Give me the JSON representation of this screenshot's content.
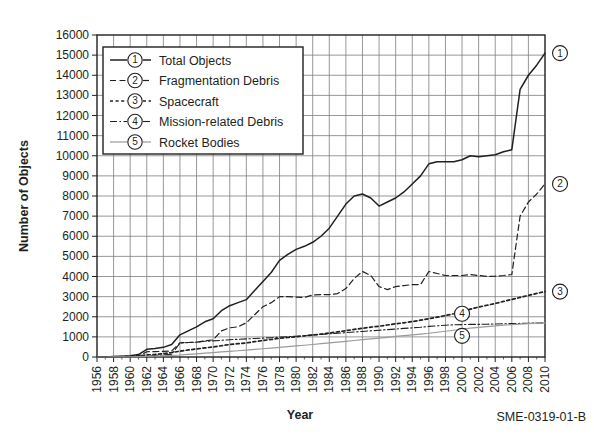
{
  "chart_data": {
    "type": "line",
    "title": "",
    "xlabel": "Year",
    "ylabel": "Number of Objects",
    "xlim": [
      1956,
      2010
    ],
    "ylim": [
      0,
      16000
    ],
    "grid": true,
    "legend_position": "top-left",
    "caption": "SME-0319-01-B",
    "y_ticks": [
      "0",
      "1000",
      "2000",
      "3000",
      "4000",
      "5000",
      "6000",
      "7000",
      "8000",
      "9000",
      "10000",
      "11000",
      "12000",
      "13000",
      "14000",
      "15000",
      "16000"
    ],
    "x_ticks": [
      "1956",
      "1958",
      "1960",
      "1962",
      "1964",
      "1966",
      "1968",
      "1970",
      "1972",
      "1974",
      "1976",
      "1978",
      "1980",
      "1982",
      "1984",
      "1986",
      "1988",
      "1990",
      "1992",
      "1994",
      "1996",
      "1998",
      "2000",
      "2002",
      "2004",
      "2006",
      "2008",
      "2010"
    ],
    "x": [
      1956,
      1957,
      1958,
      1959,
      1960,
      1961,
      1962,
      1963,
      1964,
      1965,
      1966,
      1967,
      1968,
      1969,
      1970,
      1971,
      1972,
      1973,
      1974,
      1975,
      1976,
      1977,
      1978,
      1979,
      1980,
      1981,
      1982,
      1983,
      1984,
      1985,
      1986,
      1987,
      1988,
      1989,
      1990,
      1991,
      1992,
      1993,
      1994,
      1995,
      1996,
      1997,
      1998,
      1999,
      2000,
      2001,
      2002,
      2003,
      2004,
      2005,
      2006,
      2007,
      2008,
      2009,
      2010
    ],
    "series": [
      {
        "name": "Total Objects",
        "marker": "1",
        "style": "solid",
        "end_value": 15100,
        "values": [
          0,
          5,
          20,
          40,
          60,
          120,
          380,
          420,
          480,
          620,
          1100,
          1300,
          1500,
          1750,
          1900,
          2300,
          2550,
          2700,
          2850,
          3300,
          3750,
          4200,
          4800,
          5100,
          5350,
          5500,
          5700,
          6000,
          6400,
          7000,
          7600,
          8000,
          8100,
          7900,
          7500,
          7700,
          7900,
          8200,
          8600,
          9000,
          9600,
          9700,
          9700,
          9700,
          9800,
          10000,
          9950,
          10000,
          10050,
          10200,
          10300,
          13300,
          14000,
          14500,
          15100
        ]
      },
      {
        "name": "Fragmentation Debris",
        "marker": "2",
        "style": "dashed",
        "end_value": 8600,
        "values": [
          0,
          0,
          0,
          0,
          0,
          40,
          260,
          270,
          280,
          300,
          700,
          720,
          740,
          800,
          850,
          1300,
          1450,
          1500,
          1700,
          2100,
          2500,
          2700,
          3000,
          3000,
          2980,
          2960,
          3080,
          3100,
          3100,
          3150,
          3400,
          3900,
          4250,
          4050,
          3500,
          3350,
          3500,
          3550,
          3600,
          3600,
          4250,
          4150,
          4050,
          4050,
          4050,
          4100,
          4050,
          4000,
          4020,
          4050,
          4100,
          7000,
          7700,
          8100,
          8600
        ]
      },
      {
        "name": "Spacecraft",
        "marker": "3",
        "style": "dotted",
        "end_value": 3250,
        "values": [
          0,
          2,
          10,
          20,
          35,
          60,
          100,
          130,
          170,
          220,
          290,
          350,
          400,
          450,
          500,
          560,
          620,
          660,
          700,
          760,
          820,
          870,
          930,
          970,
          1010,
          1050,
          1090,
          1140,
          1190,
          1250,
          1310,
          1370,
          1430,
          1480,
          1530,
          1590,
          1650,
          1700,
          1760,
          1830,
          1900,
          1980,
          2060,
          2150,
          2250,
          2380,
          2480,
          2570,
          2660,
          2760,
          2860,
          2960,
          3060,
          3160,
          3250
        ]
      },
      {
        "name": "Mission-related Debris",
        "marker": "4",
        "style": "dashdot",
        "end_value": 1700,
        "values": [
          0,
          1,
          4,
          8,
          14,
          30,
          55,
          75,
          100,
          130,
          700,
          720,
          740,
          780,
          800,
          830,
          860,
          880,
          900,
          920,
          940,
          960,
          990,
          1010,
          1030,
          1060,
          1090,
          1120,
          1150,
          1180,
          1210,
          1240,
          1270,
          1300,
          1330,
          1360,
          1390,
          1420,
          1450,
          1480,
          1520,
          1550,
          1580,
          1600,
          1610,
          1620,
          1620,
          1630,
          1640,
          1650,
          1660,
          1670,
          1680,
          1690,
          1700
        ]
      },
      {
        "name": "Rocket Bodies",
        "marker": "5",
        "style": "thin-solid",
        "end_value": 1700,
        "values": [
          0,
          1,
          3,
          6,
          10,
          18,
          30,
          45,
          60,
          80,
          100,
          130,
          160,
          190,
          220,
          250,
          280,
          310,
          340,
          375,
          410,
          445,
          480,
          515,
          550,
          585,
          620,
          660,
          700,
          740,
          780,
          820,
          860,
          900,
          940,
          980,
          1020,
          1060,
          1100,
          1140,
          1180,
          1230,
          1280,
          1330,
          1380,
          1430,
          1470,
          1510,
          1550,
          1580,
          1610,
          1635,
          1660,
          1680,
          1700
        ]
      }
    ],
    "end_markers": [
      {
        "label": "1",
        "value": 15100
      },
      {
        "label": "2",
        "value": 8600
      },
      {
        "label": "3",
        "value": 3250
      }
    ],
    "inline_markers": [
      {
        "label": "4",
        "year": 2000,
        "value": 2150
      },
      {
        "label": "5",
        "year": 2000,
        "value": 1050
      }
    ]
  },
  "legend": {
    "items": [
      {
        "marker": "1",
        "label": "Total Objects"
      },
      {
        "marker": "2",
        "label": "Fragmentation Debris"
      },
      {
        "marker": "3",
        "label": "Spacecraft"
      },
      {
        "marker": "4",
        "label": "Mission-related Debris"
      },
      {
        "marker": "5",
        "label": "Rocket Bodies"
      }
    ]
  },
  "colors": {
    "ink": "#231f20",
    "grid": "#7e7e7e",
    "light_line": "#9a9a9a",
    "background": "#ffffff"
  }
}
